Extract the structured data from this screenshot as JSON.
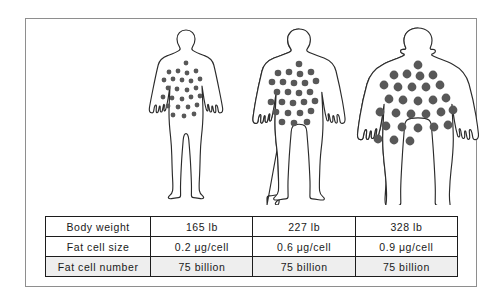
{
  "panel": {
    "name": "fat-cell-comparison-figure"
  },
  "figures": [
    {
      "id": "slim",
      "label": "slim body figure",
      "dot_radius": 2.4,
      "dot_count": 26
    },
    {
      "id": "overweight",
      "label": "overweight body figure",
      "dot_radius": 3.3,
      "dot_count": 26
    },
    {
      "id": "obese",
      "label": "obese body figure",
      "dot_radius": 4.4,
      "dot_count": 26
    }
  ],
  "table": {
    "rows": [
      {
        "label": "Body weight",
        "shaded": false,
        "values": [
          "165 lb",
          "227 lb",
          "328 lb"
        ]
      },
      {
        "label": "Fat cell size",
        "shaded": false,
        "values": [
          "0.2 μg/cell",
          "0.6 μg/cell",
          "0.9 μg/cell"
        ]
      },
      {
        "label": "Fat cell number",
        "shaded": true,
        "values": [
          "75 billion",
          "75 billion",
          "75 billion"
        ]
      }
    ]
  },
  "colors": {
    "dot": "#585858",
    "outline": "#2b2b2b",
    "frame": "#8e8e8e",
    "shaded_row": "#eeeeee",
    "table_border": "#1c1c1c"
  }
}
